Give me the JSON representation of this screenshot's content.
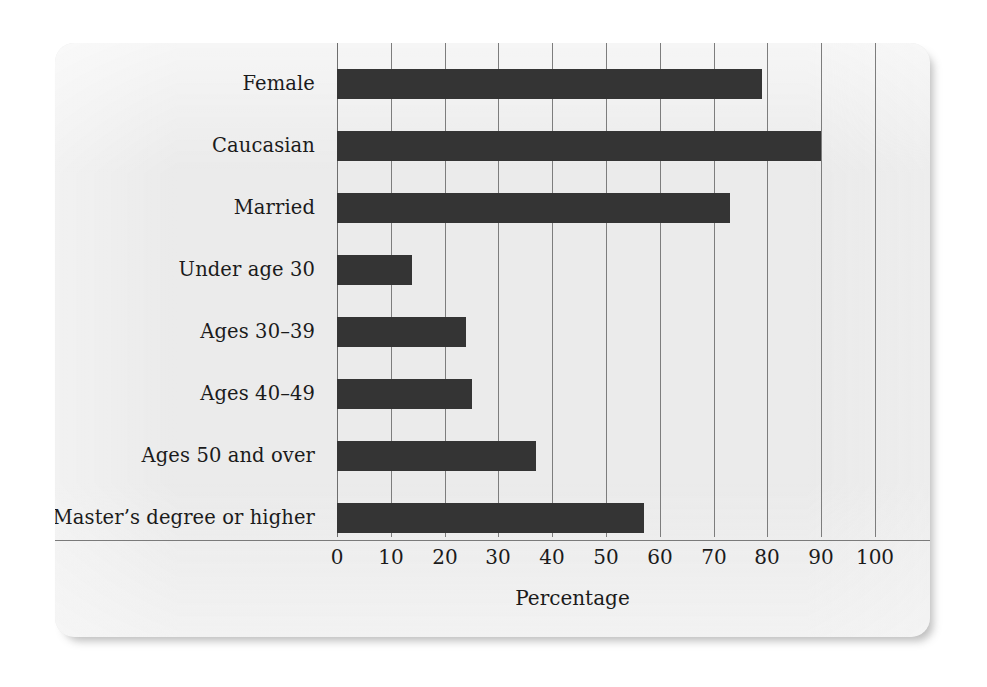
{
  "chart_data": {
    "type": "bar",
    "orientation": "horizontal",
    "title": "",
    "xlabel": "Percentage",
    "ylabel": "",
    "xlim": [
      0,
      100
    ],
    "xticks": [
      0,
      10,
      20,
      30,
      40,
      50,
      60,
      70,
      80,
      90,
      100
    ],
    "xtick_labels": [
      "0",
      "10",
      "20",
      "30",
      "40",
      "50",
      "60",
      "70",
      "80",
      "90",
      "100"
    ],
    "grid": "vertical gridlines at every 10 percent",
    "legend": "none",
    "categories": [
      "Female",
      "Caucasian",
      "Married",
      "Under age 30",
      "Ages 30–39",
      "Ages 40–49",
      "Ages 50 and over",
      "Master’s degree or higher"
    ],
    "values": [
      79,
      90,
      73,
      14,
      24,
      25,
      37,
      57
    ],
    "bar_color": "#343434",
    "panel_color": "#ebebeb",
    "gridline_color": "#7d7d7d",
    "text_color": "#1b1b1b"
  }
}
